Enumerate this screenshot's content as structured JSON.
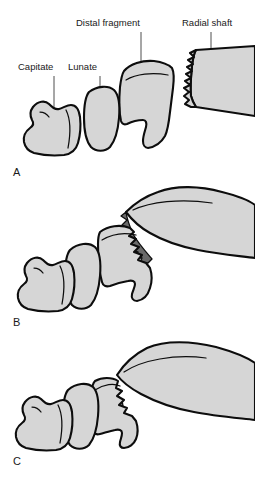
{
  "figure": {
    "width": 255,
    "height": 481,
    "background_color": "#ffffff",
    "bone_fill_color": "#d6d6d6",
    "bone_outline_color": "#0d0d0d",
    "fracture_gap_color": "#6a6a6a"
  },
  "labels": [
    {
      "id": "capitate",
      "text": "Capitate",
      "x": 18,
      "y": 70,
      "leader_from_x": 54,
      "leader_from_y": 76,
      "leader_to_x": 54,
      "leader_to_y": 130
    },
    {
      "id": "lunate",
      "text": "Lunate",
      "x": 68,
      "y": 70,
      "leader_from_x": 100,
      "leader_from_y": 76,
      "leader_to_x": 100,
      "leader_to_y": 120
    },
    {
      "id": "distal-fragment",
      "text": "Distal fragment",
      "x": 76,
      "y": 26,
      "leader_from_x": 141,
      "leader_from_y": 32,
      "leader_to_x": 141,
      "leader_to_y": 115
    },
    {
      "id": "radial-shaft",
      "text": "Radial shaft",
      "x": 182,
      "y": 26,
      "leader_from_x": 211,
      "leader_from_y": 32,
      "leader_to_x": 211,
      "leader_to_y": 82
    }
  ],
  "panels": [
    {
      "id": "a",
      "letter": "A",
      "x": 13,
      "y": 176,
      "caption": "Undisplaced distal radius fracture with intact alignment of carpus and radial shaft"
    },
    {
      "id": "b",
      "letter": "B",
      "x": 13,
      "y": 326,
      "caption": "Dorsally displaced and angulated distal fragment with widened fracture gap"
    },
    {
      "id": "c",
      "letter": "C",
      "x": 13,
      "y": 465,
      "caption": "Impacted and shortened fracture with dorsal tilt of the distal fragment"
    }
  ],
  "anatomy": {
    "capitate": "Capitate",
    "lunate": "Lunate",
    "distal_fragment": "Distal fragment",
    "radial_shaft": "Radial shaft"
  }
}
